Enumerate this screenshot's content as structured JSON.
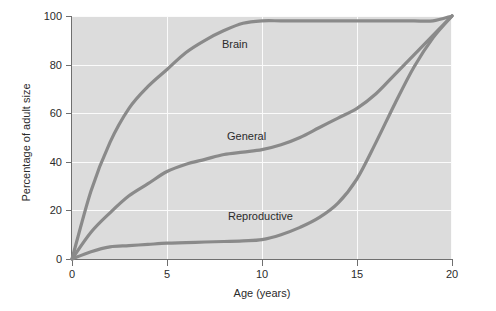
{
  "chart_data": {
    "type": "line",
    "title": "",
    "xlabel": "Age (years)",
    "ylabel": "Percentage of adult size",
    "xlim": [
      0,
      20
    ],
    "ylim": [
      0,
      100
    ],
    "xticks": [
      0,
      5,
      10,
      15,
      20
    ],
    "yticks": [
      0,
      20,
      40,
      60,
      80,
      100
    ],
    "xtick_labels": [
      "0",
      "5",
      "10",
      "15",
      "20"
    ],
    "ytick_labels": [
      "0",
      "20",
      "40",
      "60",
      "80",
      "100"
    ],
    "grid": true,
    "legend_position": "inline-annotations",
    "panel_color": "#dcdcdc",
    "gridline_color": "#fbfbfb",
    "curve_color": "#8a8a8a",
    "axis_color": "#6f6f6f",
    "x": [
      0,
      1,
      2,
      3,
      4,
      5,
      6,
      7,
      8,
      9,
      10,
      11,
      12,
      13,
      14,
      15,
      16,
      17,
      18,
      19,
      20
    ],
    "series": [
      {
        "name": "Brain",
        "label": "Brain",
        "values": [
          0,
          28,
          48,
          62,
          71,
          78,
          85,
          90,
          94,
          97,
          98,
          98,
          98,
          98,
          98,
          98,
          98,
          98,
          98,
          98,
          100
        ]
      },
      {
        "name": "General",
        "label": "General",
        "values": [
          0,
          11,
          19,
          26,
          31,
          36,
          39,
          41,
          43,
          44,
          45,
          47,
          50,
          54,
          58,
          62,
          68,
          76,
          84,
          92,
          100
        ]
      },
      {
        "name": "Reproductive",
        "label": "Reproductive",
        "values": [
          0,
          3,
          5,
          5.5,
          6,
          6.5,
          6.7,
          7,
          7.2,
          7.5,
          8,
          10,
          13,
          17,
          23,
          33,
          48,
          64,
          79,
          91,
          100
        ]
      }
    ]
  },
  "annotations": {
    "brain": "Brain",
    "general": "General",
    "reproductive": "Reproductive"
  }
}
